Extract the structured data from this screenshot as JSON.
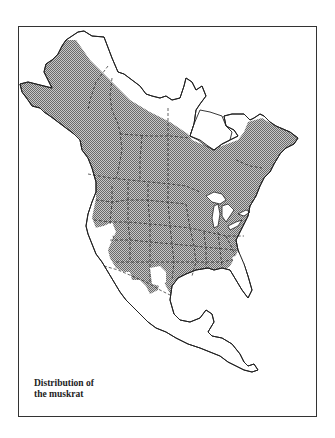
{
  "figure": {
    "caption_line1": "Distribution of",
    "caption_line2": "the muskrat",
    "subject": "muskrat",
    "region": "North America"
  },
  "legend": {
    "range_fill": "hatched gray",
    "range_color": "#9a9a9a",
    "outline_color": "#222222",
    "border_style": "dashed"
  }
}
